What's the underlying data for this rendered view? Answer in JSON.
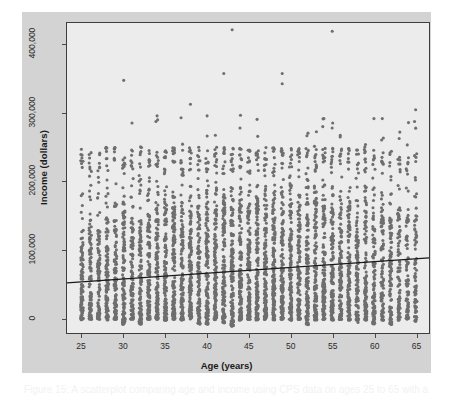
{
  "figure": {
    "caption": "Figure 15: A scatterplot comparing age and income using CPS data on ages 25 to 65 with a",
    "panel_color": "#d3d3d3",
    "plot_bg_color": "#ececec",
    "frame_color": "#3d3d3d",
    "point_color": "#6e6e6e",
    "line_color": "#1a1a1a"
  },
  "chart_data": {
    "type": "scatter",
    "title": "",
    "xlabel": "Age (years)",
    "ylabel": "Income (dollars)",
    "xlim": [
      23.2,
      66.6
    ],
    "ylim": [
      -22000,
      432000
    ],
    "grid": false,
    "legend": null,
    "xticks": [
      25,
      30,
      35,
      40,
      45,
      50,
      55,
      60,
      65
    ],
    "xtick_labels": [
      "25",
      "30",
      "35",
      "40",
      "45",
      "50",
      "55",
      "60",
      "65"
    ],
    "yticks": [
      0,
      100000,
      200000,
      300000,
      400000
    ],
    "ytick_labels": [
      "0",
      "100,000",
      "200,000",
      "300,000",
      "400,000"
    ],
    "point_marker": "circle",
    "point_size_px": 3.1,
    "n_points_approx": 4200,
    "annotations": [
      "Dense vertical columns of points at each integer age from 25 to 65",
      "Secondary dense band of points clustered near 220,000-250,000 (top-coded values)",
      "Extreme outliers near 420,000 at ages 43 and 55"
    ],
    "trendline": {
      "name": "least-squares regression line",
      "type": "line",
      "x": [
        23.2,
        66.6
      ],
      "y": [
        51500,
        88000
      ],
      "slope_per_year": 841,
      "intercept": 31990,
      "color": "#1a1a1a",
      "width_px": 1.2
    },
    "series": [
      {
        "name": "Income vs Age",
        "ages": [
          25,
          26,
          27,
          28,
          29,
          30,
          31,
          32,
          33,
          34,
          35,
          36,
          37,
          38,
          39,
          40,
          41,
          42,
          43,
          44,
          45,
          46,
          47,
          48,
          49,
          50,
          51,
          52,
          53,
          54,
          55,
          56,
          57,
          58,
          59,
          60,
          61,
          62,
          63,
          64,
          65
        ],
        "column_counts": [
          96,
          92,
          95,
          100,
          104,
          110,
          106,
          108,
          112,
          116,
          122,
          126,
          124,
          120,
          118,
          122,
          126,
          128,
          130,
          128,
          132,
          130,
          134,
          130,
          132,
          128,
          126,
          122,
          120,
          118,
          116,
          110,
          108,
          100,
          104,
          96,
          90,
          84,
          80,
          74,
          70
        ],
        "column_max_income": [
          138000,
          144000,
          134000,
          150000,
          145000,
          158000,
          150000,
          148000,
          152000,
          160000,
          166000,
          162000,
          158000,
          160000,
          162000,
          170000,
          166000,
          172000,
          168000,
          170000,
          166000,
          172000,
          168000,
          170000,
          166000,
          168000,
          164000,
          172000,
          175000,
          166000,
          162000,
          160000,
          168000,
          152000,
          178000,
          156000,
          160000,
          152000,
          158000,
          150000,
          156000
        ],
        "column_min_income": [
          -3000,
          -2000,
          -2000,
          -3000,
          -2000,
          -9000,
          -2000,
          -9000,
          -2000,
          -2000,
          -3000,
          -2000,
          -3000,
          -2000,
          -9000,
          -9000,
          -3000,
          -7000,
          -12000,
          -3000,
          -2000,
          -3000,
          -2000,
          -3000,
          -2000,
          -3000,
          -2000,
          -10000,
          -3000,
          -2000,
          -3000,
          -2000,
          -3000,
          -7000,
          -3000,
          -9000,
          -3000,
          -10000,
          -3000,
          -2000,
          -5000
        ],
        "high_band_income_range": [
          195000,
          250000
        ],
        "outliers": [
          {
            "age": 30,
            "income": 348000
          },
          {
            "age": 38,
            "income": 313000
          },
          {
            "age": 42,
            "income": 358000
          },
          {
            "age": 43,
            "income": 422000
          },
          {
            "age": 49,
            "income": 358000
          },
          {
            "age": 49,
            "income": 343000
          },
          {
            "age": 55,
            "income": 420000
          },
          {
            "age": 65,
            "income": 305000
          },
          {
            "age": 60,
            "income": 292000
          },
          {
            "age": 61,
            "income": 292000
          },
          {
            "age": 34,
            "income": 296000
          },
          {
            "age": 40,
            "income": 296000
          },
          {
            "age": 44,
            "income": 297000
          },
          {
            "age": 54,
            "income": 292000
          },
          {
            "age": 65,
            "income": 278000
          }
        ]
      }
    ]
  },
  "axis": {
    "y_title": "Income (dollars)",
    "x_title": "Age (years)"
  }
}
